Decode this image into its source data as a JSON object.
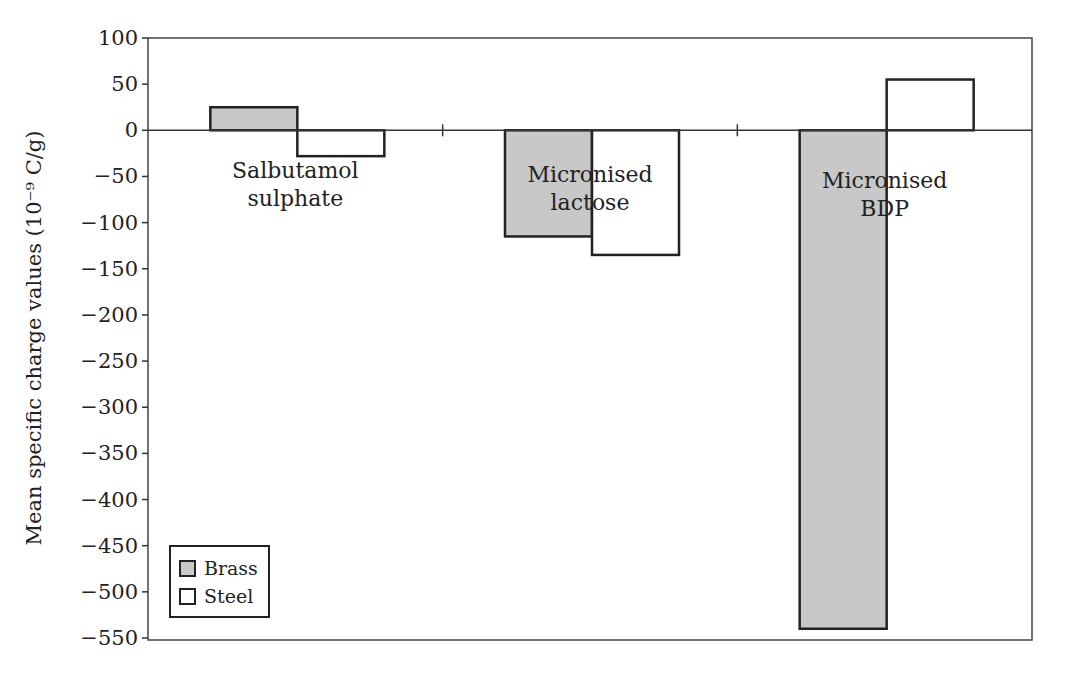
{
  "chart_data": {
    "type": "bar",
    "title": "",
    "xlabel": "",
    "ylabel": "Mean specific charge values (10⁻⁹ C/g)",
    "ylim": [
      -550,
      100
    ],
    "yticks": [
      100,
      50,
      0,
      -50,
      -100,
      -150,
      -200,
      -250,
      -300,
      -350,
      -400,
      -450,
      -500,
      -550
    ],
    "ytick_labels": [
      "100",
      "50",
      "0",
      "−50",
      "−100",
      "−150",
      "−200",
      "−250",
      "−300",
      "−350",
      "−400",
      "−450",
      "−500",
      "−550"
    ],
    "grid": false,
    "legend_position": "lower left (inside plot)",
    "categories": [
      "Salbutamol sulphate",
      "Micronised lactose",
      "Micronised BDP"
    ],
    "category_label_lines": [
      [
        "Salbutamol",
        "sulphate"
      ],
      [
        "Micronised",
        "lactose"
      ],
      [
        "Micronised",
        "BDP"
      ]
    ],
    "series": [
      {
        "name": "Brass",
        "color": "#c8c8c8",
        "values": [
          25,
          -115,
          -540
        ]
      },
      {
        "name": "Steel",
        "color": "#ffffff",
        "values": [
          -28,
          -135,
          55
        ]
      }
    ]
  },
  "legend": {
    "items": [
      {
        "label": "Brass",
        "color": "#c8c8c8"
      },
      {
        "label": "Steel",
        "color": "#ffffff"
      }
    ]
  }
}
